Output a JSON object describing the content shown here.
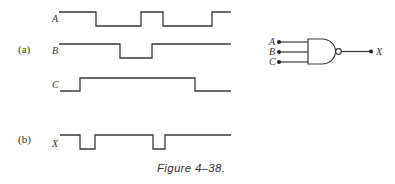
{
  "figure": {
    "caption": "Figure 4–38.",
    "part_a_label": "(a)",
    "part_b_label": "(b)",
    "stroke_color": "#3a3a3a",
    "text_color": "#333333"
  },
  "waveforms": [
    {
      "name": "A",
      "high_y": 12,
      "low_y": 26,
      "label_x": 52,
      "label_y": 22,
      "x_start": 59,
      "x_end": 231,
      "initial": "high",
      "transitions": [
        96,
        141,
        163,
        212
      ]
    },
    {
      "name": "B",
      "high_y": 44,
      "low_y": 58,
      "label_x": 52,
      "label_y": 54,
      "x_start": 59,
      "x_end": 231,
      "initial": "high",
      "transitions": [
        120,
        152
      ]
    },
    {
      "name": "C",
      "high_y": 78,
      "low_y": 91,
      "label_x": 52,
      "label_y": 88,
      "x_start": 60,
      "x_end": 231,
      "initial": "low",
      "transitions": [
        80,
        195
      ]
    },
    {
      "name": "X",
      "high_y": 135,
      "low_y": 149,
      "label_x": 52,
      "label_y": 147,
      "x_start": 60,
      "x_end": 231,
      "initial": "high",
      "transitions": [
        80,
        95,
        153,
        165
      ]
    }
  ],
  "gate": {
    "type": "NAND",
    "inputs": [
      "A",
      "B",
      "C"
    ],
    "output": "X"
  }
}
